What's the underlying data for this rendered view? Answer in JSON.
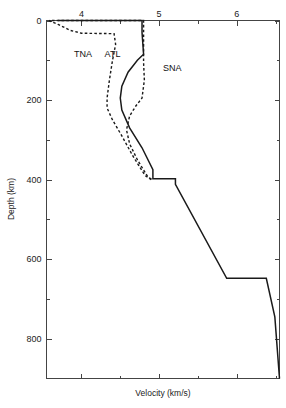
{
  "chart_data": {
    "type": "line",
    "title": "",
    "xlabel": "Velocity (km/s)",
    "ylabel": "Depth (km)",
    "xlim": [
      3.55,
      6.55
    ],
    "ylim": [
      0,
      900
    ],
    "y_inverted": true,
    "grid": false,
    "legend_position": "inline-annotations",
    "x_ticks": [
      4,
      5,
      6
    ],
    "x_tick_labels": [
      "4",
      "5",
      "6"
    ],
    "x_minor_ticks": [
      3.5,
      4.5,
      5.5,
      6.5
    ],
    "y_ticks": [
      0,
      200,
      400,
      600,
      800
    ],
    "y_tick_labels": [
      "0",
      "200",
      "400",
      "600",
      "800"
    ],
    "y_minor_ticks": [
      100,
      300,
      500,
      700
    ],
    "x_axis_position": "top",
    "series": [
      {
        "name": "SNA",
        "style": "solid",
        "label": "SNA",
        "label_x": 5.17,
        "label_y": 128,
        "points": [
          [
            3.7,
            0
          ],
          [
            4.78,
            0
          ],
          [
            4.78,
            30
          ],
          [
            4.8,
            85
          ],
          [
            4.72,
            100
          ],
          [
            4.6,
            130
          ],
          [
            4.52,
            165
          ],
          [
            4.5,
            195
          ],
          [
            4.52,
            225
          ],
          [
            4.62,
            270
          ],
          [
            4.78,
            320
          ],
          [
            4.92,
            375
          ],
          [
            4.92,
            398
          ],
          [
            5.21,
            398
          ],
          [
            5.21,
            412
          ],
          [
            5.87,
            648
          ],
          [
            6.38,
            648
          ],
          [
            6.49,
            745
          ],
          [
            6.55,
            900
          ]
        ]
      },
      {
        "name": "ATL",
        "style": "dashed",
        "label": "ATL",
        "label_x": 4.4,
        "label_y": 92,
        "points": [
          [
            3.62,
            0
          ],
          [
            4.8,
            0
          ],
          [
            4.8,
            30
          ],
          [
            4.8,
            105
          ],
          [
            4.81,
            150
          ],
          [
            4.78,
            195
          ],
          [
            4.7,
            215
          ],
          [
            4.62,
            240
          ],
          [
            4.58,
            275
          ],
          [
            4.62,
            310
          ],
          [
            4.72,
            350
          ],
          [
            4.86,
            395
          ],
          [
            4.92,
            400
          ]
        ]
      },
      {
        "name": "TNA",
        "style": "dashed",
        "label": "TNA",
        "label_x": 4.02,
        "label_y": 92,
        "points": [
          [
            3.58,
            0
          ],
          [
            3.7,
            10
          ],
          [
            3.86,
            25
          ],
          [
            4.0,
            32
          ],
          [
            4.38,
            33
          ],
          [
            4.42,
            33
          ],
          [
            4.44,
            60
          ],
          [
            4.4,
            100
          ],
          [
            4.36,
            150
          ],
          [
            4.33,
            195
          ],
          [
            4.33,
            220
          ],
          [
            4.4,
            250
          ],
          [
            4.52,
            290
          ],
          [
            4.66,
            340
          ],
          [
            4.82,
            390
          ],
          [
            4.9,
            400
          ]
        ]
      }
    ]
  },
  "axes": {
    "x_title": "Velocity (km/s)",
    "y_title": "Depth (km)"
  },
  "annotations": {
    "tna": "TNA",
    "atl": "ATL",
    "sna": "SNA"
  },
  "style": {
    "curve_color": "#1a1a1a",
    "axis_color": "#444444",
    "text_color": "#222222",
    "background": "#ffffff"
  }
}
